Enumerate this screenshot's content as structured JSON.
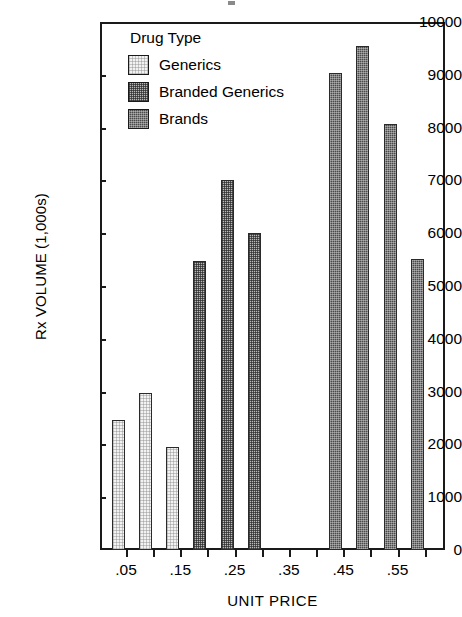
{
  "chart_data": {
    "type": "bar",
    "title": "",
    "xlabel": "UNIT PRICE",
    "ylabel": "Rx VOLUME (1,000s)",
    "ylim": [
      0,
      10000
    ],
    "ytick_labels": [
      "10000",
      "9000",
      "8000",
      "7000",
      "6000",
      "5000",
      "4000",
      "3000",
      "2000",
      "1000",
      "0"
    ],
    "ytick_values": [
      10000,
      9000,
      8000,
      7000,
      6000,
      5000,
      4000,
      3000,
      2000,
      1000,
      0
    ],
    "xtick_labels": [
      ".05",
      ".15",
      ".25",
      ".35",
      ".45",
      ".55"
    ],
    "xtick_values": [
      0.05,
      0.15,
      0.25,
      0.35,
      0.45,
      0.55
    ],
    "x_minor_ticks": [
      0.05,
      0.1,
      0.15,
      0.2,
      0.25,
      0.3,
      0.35,
      0.4,
      0.45,
      0.5,
      0.55,
      0.6
    ],
    "grid": false,
    "legend_position": "upper-left-inside",
    "legend_title": "Drug Type",
    "series": [
      {
        "name": "Generics",
        "fill": "light-dotted",
        "color": "#f2f2f2",
        "points": [
          {
            "x": 0.05,
            "value": 2470
          },
          {
            "x": 0.1,
            "value": 2980
          },
          {
            "x": 0.15,
            "value": 1950
          }
        ]
      },
      {
        "name": "Branded Generics",
        "fill": "medium-checker",
        "color": "#b9b9b9",
        "points": [
          {
            "x": 0.2,
            "value": 5470
          },
          {
            "x": 0.25,
            "value": 7000
          },
          {
            "x": 0.3,
            "value": 6000
          }
        ]
      },
      {
        "name": "Brands",
        "fill": "dark-checker",
        "color": "#4a4a4a",
        "points": [
          {
            "x": 0.45,
            "value": 9030
          },
          {
            "x": 0.5,
            "value": 9550
          },
          {
            "x": 0.55,
            "value": 8060
          },
          {
            "x": 0.6,
            "value": 5520
          }
        ]
      }
    ]
  },
  "legend": {
    "title": "Drug Type",
    "items": [
      {
        "label": "Generics",
        "fill_class": "fill-generics"
      },
      {
        "label": "Branded Generics",
        "fill_class": "fill-branded"
      },
      {
        "label": "Brands",
        "fill_class": "fill-brands"
      }
    ]
  },
  "axes": {
    "y_title": "Rx VOLUME (1,000s)",
    "x_title": "UNIT PRICE"
  }
}
